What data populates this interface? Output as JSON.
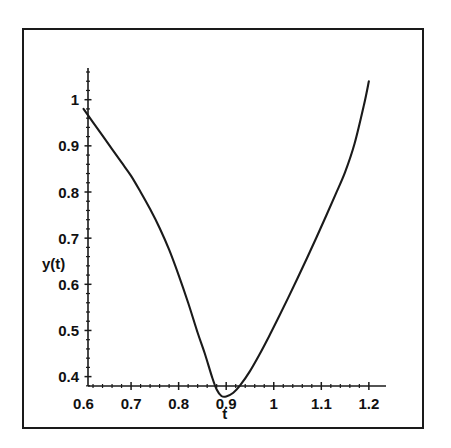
{
  "chart_data": {
    "type": "line",
    "title": "",
    "subtitle": "",
    "xlabel": "t",
    "ylabel": "y(t)",
    "xlim": [
      0.58,
      1.215
    ],
    "ylim": [
      0.345,
      1.06
    ],
    "grid": false,
    "legend": null,
    "x_ticks": [
      0.6,
      0.7,
      0.8,
      0.9,
      1.0,
      1.1,
      1.2
    ],
    "x_tick_labels": [
      "0.6",
      "0.7",
      "0.8",
      "0.9",
      "1",
      "1.1",
      "1.2"
    ],
    "x_minor_tick_step": 0.02,
    "y_ticks": [
      0.4,
      0.5,
      0.6,
      0.7,
      0.8,
      0.9,
      1.0
    ],
    "y_tick_labels": [
      "0.4",
      "0.5",
      "0.6",
      "0.7",
      "0.8",
      "0.9",
      "1"
    ],
    "y_minor_tick_step": 0.02,
    "series": [
      {
        "name": "y(t)",
        "color": "#1a1a1a",
        "x": [
          0.6,
          0.62,
          0.64,
          0.66,
          0.68,
          0.7,
          0.72,
          0.74,
          0.76,
          0.78,
          0.8,
          0.82,
          0.84,
          0.855,
          0.87,
          0.88,
          0.89,
          0.9,
          0.915,
          0.93,
          0.95,
          0.97,
          0.99,
          1.01,
          1.03,
          1.05,
          1.07,
          1.09,
          1.11,
          1.13,
          1.15,
          1.17,
          1.19,
          1.2
        ],
        "y": [
          0.98,
          0.951,
          0.922,
          0.893,
          0.864,
          0.835,
          0.8,
          0.763,
          0.722,
          0.675,
          0.62,
          0.56,
          0.495,
          0.45,
          0.4,
          0.372,
          0.358,
          0.357,
          0.365,
          0.382,
          0.412,
          0.448,
          0.487,
          0.528,
          0.57,
          0.613,
          0.657,
          0.702,
          0.748,
          0.795,
          0.843,
          0.905,
          0.99,
          1.04
        ]
      }
    ],
    "annotations": []
  },
  "axes": {
    "y_axis_title": "y(t)",
    "x_axis_title": "t"
  }
}
